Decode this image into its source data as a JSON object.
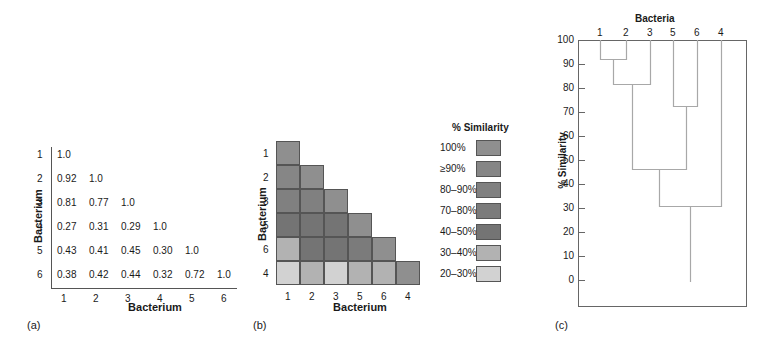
{
  "panels": {
    "a": {
      "label": "(a)",
      "ylabel": "Bacterium",
      "xlabel": "Bacterium",
      "row_labels": [
        "1",
        "2",
        "3",
        "4",
        "5",
        "6"
      ],
      "col_labels": [
        "1",
        "2",
        "3",
        "4",
        "5",
        "6"
      ],
      "matrix": [
        [
          "1.0"
        ],
        [
          "0.92",
          "1.0"
        ],
        [
          "0.81",
          "0.77",
          "1.0"
        ],
        [
          "0.27",
          "0.31",
          "0.29",
          "1.0"
        ],
        [
          "0.43",
          "0.41",
          "0.45",
          "0.30",
          "1.0"
        ],
        [
          "0.38",
          "0.42",
          "0.44",
          "0.32",
          "0.72",
          "1.0"
        ]
      ]
    },
    "b": {
      "label": "(b)",
      "ylabel": "Bacterium",
      "xlabel": "Bacterium",
      "order": [
        "1",
        "2",
        "3",
        "5",
        "6",
        "4"
      ],
      "legend_title": "% Similarity",
      "legend": [
        {
          "label": "100%",
          "color": "#8f8f8f"
        },
        {
          "label": "≥90%",
          "color": "#868686"
        },
        {
          "label": "80–90%",
          "color": "#808080"
        },
        {
          "label": "70–80%",
          "color": "#7b7b7b"
        },
        {
          "label": "40–50%",
          "color": "#747474"
        },
        {
          "label": "30–40%",
          "color": "#b2b2b2"
        },
        {
          "label": "20–30%",
          "color": "#d2d2d2"
        }
      ],
      "cells": [
        [
          0
        ],
        [
          1,
          0
        ],
        [
          2,
          2,
          0
        ],
        [
          4,
          4,
          4,
          0
        ],
        [
          5,
          4,
          4,
          3,
          0
        ],
        [
          6,
          5,
          6,
          5,
          5,
          0
        ]
      ]
    },
    "c": {
      "label": "(c)",
      "title": "Bacteria",
      "ylabel": "% Similarity",
      "leaves": [
        "1",
        "2",
        "3",
        "5",
        "6",
        "4"
      ],
      "yticks": [
        "100",
        "90",
        "80",
        "70",
        "60",
        "50",
        "40",
        "30",
        "20",
        "10",
        "0"
      ]
    }
  },
  "chart_data": [
    {
      "type": "table",
      "title": "Similarity matrix",
      "xlabel": "Bacterium",
      "ylabel": "Bacterium",
      "rows": [
        "1",
        "2",
        "3",
        "4",
        "5",
        "6"
      ],
      "cols": [
        "1",
        "2",
        "3",
        "4",
        "5",
        "6"
      ],
      "values": [
        [
          1.0
        ],
        [
          0.92,
          1.0
        ],
        [
          0.81,
          0.77,
          1.0
        ],
        [
          0.27,
          0.31,
          0.29,
          1.0
        ],
        [
          0.43,
          0.41,
          0.45,
          0.3,
          1.0
        ],
        [
          0.38,
          0.42,
          0.44,
          0.32,
          0.72,
          1.0
        ]
      ]
    },
    {
      "type": "heatmap",
      "title": "Reordered similarity matrix",
      "xlabel": "Bacterium",
      "ylabel": "Bacterium",
      "order": [
        "1",
        "2",
        "3",
        "5",
        "6",
        "4"
      ],
      "legend_title": "% Similarity",
      "legend": [
        "100%",
        "≥90%",
        "80–90%",
        "70–80%",
        "40–50%",
        "30–40%",
        "20–30%"
      ]
    },
    {
      "type": "dendrogram",
      "title": "Bacteria",
      "ylabel": "% Similarity",
      "ylim": [
        0,
        100
      ],
      "yticks": [
        0,
        10,
        20,
        30,
        40,
        50,
        60,
        70,
        80,
        90,
        100
      ],
      "leaves": [
        "1",
        "2",
        "3",
        "5",
        "6",
        "4"
      ],
      "merges": [
        {
          "clusters": [
            "1",
            "2"
          ],
          "similarity": 92
        },
        {
          "clusters": [
            "1-2",
            "3"
          ],
          "similarity": 81
        },
        {
          "clusters": [
            "5",
            "6"
          ],
          "similarity": 72
        },
        {
          "clusters": [
            "1-2-3",
            "5-6"
          ],
          "similarity": 46
        },
        {
          "clusters": [
            "1-2-3-5-6",
            "4"
          ],
          "similarity": 31
        }
      ]
    }
  ]
}
